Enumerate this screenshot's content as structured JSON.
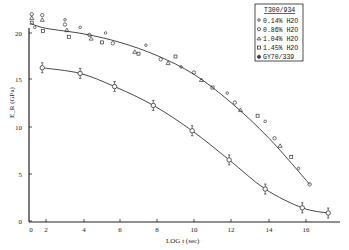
{
  "chart_data": {
    "type": "scatter",
    "title": "",
    "xlabel": "LOG t (sec)",
    "ylabel": "E_R (GPa)",
    "xlim": [
      0,
      17.5
    ],
    "ylim": [
      0,
      21
    ],
    "grid": false,
    "legend_position": "top-right",
    "x_ticks": [
      {
        "label": "0",
        "px": 31
      },
      {
        "label": "2",
        "px": 46
      },
      {
        "label": "4",
        "px": 84
      },
      {
        "label": "6",
        "px": 120
      },
      {
        "label": "8",
        "px": 157
      },
      {
        "label": "10",
        "px": 194
      },
      {
        "label": "12",
        "px": 231
      },
      {
        "label": "14",
        "px": 269
      },
      {
        "label": "16",
        "px": 306
      }
    ],
    "y_ticks": [
      {
        "label": "0",
        "px": 221
      },
      {
        "label": "5",
        "px": 174
      },
      {
        "label": "10",
        "px": 127
      },
      {
        "label": "15",
        "px": 79
      },
      {
        "label": "20",
        "px": 33
      }
    ],
    "legend": {
      "title": "T300/934",
      "entries": [
        {
          "marker": "circle-small",
          "label": "0.14% H2O"
        },
        {
          "marker": "circle",
          "label": "0.86% H2O"
        },
        {
          "marker": "triangle",
          "label": "1.04% H2O"
        },
        {
          "marker": "square",
          "label": "1.45% H2O"
        },
        {
          "marker": "circle-filled",
          "label": "GY70/339"
        }
      ]
    },
    "series": [
      {
        "name": "T300/934 (wet, various H2O)",
        "curve": [
          [
            0,
            21.0
          ],
          [
            2,
            20.5
          ],
          [
            4,
            19.9
          ],
          [
            6,
            19.0
          ],
          [
            8,
            17.6
          ],
          [
            10,
            15.6
          ],
          [
            12,
            12.6
          ],
          [
            14,
            8.8
          ],
          [
            16.2,
            3.9
          ]
        ],
        "points": [
          [
            0.1,
            22.0
          ],
          [
            0.1,
            21.6
          ],
          [
            0.1,
            21.1
          ],
          [
            0.5,
            20.6
          ],
          [
            1.5,
            21.9
          ],
          [
            1.5,
            21.4
          ],
          [
            1.6,
            20.2
          ],
          [
            3.0,
            21.4
          ],
          [
            3.0,
            20.9
          ],
          [
            3.1,
            20.3
          ],
          [
            3.2,
            19.6
          ],
          [
            3.8,
            20.6
          ],
          [
            4.3,
            19.8
          ],
          [
            4.4,
            19.4
          ],
          [
            5.0,
            19.0
          ],
          [
            5.2,
            20.0
          ],
          [
            5.6,
            18.9
          ],
          [
            6.8,
            18.0
          ],
          [
            7.0,
            17.8
          ],
          [
            7.4,
            18.7
          ],
          [
            8.2,
            17.2
          ],
          [
            8.6,
            16.8
          ],
          [
            9.0,
            17.5
          ],
          [
            9.3,
            16.4
          ],
          [
            10.0,
            15.8
          ],
          [
            10.4,
            15.0
          ],
          [
            11.0,
            14.2
          ],
          [
            11.8,
            13.6
          ],
          [
            12.2,
            12.6
          ],
          [
            12.5,
            11.8
          ],
          [
            13.4,
            11.2
          ],
          [
            13.8,
            10.6
          ],
          [
            14.3,
            8.8
          ],
          [
            14.6,
            8.0
          ],
          [
            15.2,
            6.8
          ],
          [
            15.6,
            5.6
          ],
          [
            16.2,
            3.9
          ]
        ]
      },
      {
        "name": "GY70/339",
        "points_with_errorbars": [
          [
            1.5,
            16.3
          ],
          [
            3.8,
            15.7
          ],
          [
            5.7,
            14.3
          ],
          [
            7.8,
            12.3
          ],
          [
            9.9,
            9.6
          ],
          [
            11.9,
            6.5
          ],
          [
            13.8,
            3.4
          ],
          [
            15.8,
            1.4
          ],
          [
            17.2,
            0.85
          ]
        ]
      }
    ]
  }
}
